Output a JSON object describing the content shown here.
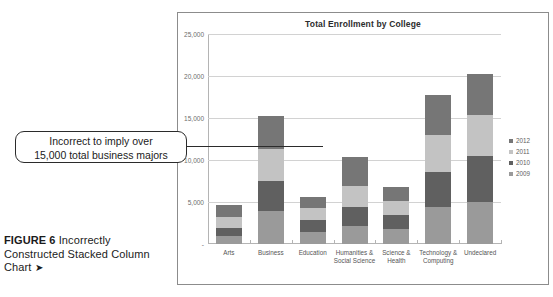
{
  "figure": {
    "label": "FIGURE 6",
    "caption": "Incorrectly Constructed Stacked Column Chart",
    "arrow": "➤"
  },
  "callout": {
    "line1": "Incorrect to imply over",
    "line2": "15,000 total business majors"
  },
  "legend": {
    "position": "right",
    "items": [
      {
        "label": "2012",
        "color": "#767676"
      },
      {
        "label": "2011",
        "color": "#c3c3c3"
      },
      {
        "label": "2010",
        "color": "#606060"
      },
      {
        "label": "2009",
        "color": "#9a9a9a"
      }
    ]
  },
  "chart_data": {
    "type": "bar",
    "subtype": "stacked-column",
    "title": "Total Enrollment by College",
    "xlabel": "",
    "ylabel": "",
    "ylim": [
      0,
      25000
    ],
    "yticks": [
      "-",
      "5,000",
      "10,000",
      "15,000",
      "20,000",
      "25,000"
    ],
    "ytick_values": [
      0,
      5000,
      10000,
      15000,
      20000,
      25000
    ],
    "grid": true,
    "categories": [
      "Arts",
      "Business",
      "Education",
      "Humanities & Social Science",
      "Science & Health",
      "Technology & Computing",
      "Undeclared"
    ],
    "category_lines": [
      [
        "Arts"
      ],
      [
        "Business"
      ],
      [
        "Education"
      ],
      [
        "Humanities &",
        "Social Science"
      ],
      [
        "Science &",
        "Health"
      ],
      [
        "Technology &",
        "Computing"
      ],
      [
        "Undeclared"
      ]
    ],
    "series": [
      {
        "name": "2009",
        "color": "#9a9a9a",
        "values": [
          1000,
          3900,
          1400,
          2150,
          1750,
          4350,
          5050
        ]
      },
      {
        "name": "2010",
        "color": "#606060",
        "values": [
          900,
          3650,
          1450,
          2300,
          1650,
          4200,
          5450
        ]
      },
      {
        "name": "2011",
        "color": "#c3c3c3",
        "values": [
          1300,
          3800,
          1400,
          2500,
          1750,
          4450,
          4900
        ]
      },
      {
        "name": "2012",
        "color": "#767676",
        "values": [
          1400,
          3900,
          1400,
          3450,
          1700,
          4800,
          4800
        ]
      }
    ],
    "totals": [
      4600,
      15250,
      5650,
      10400,
      6850,
      17800,
      20200
    ]
  }
}
